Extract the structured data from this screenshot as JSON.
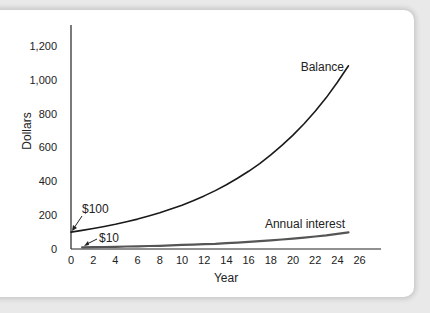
{
  "chart_data": {
    "type": "line",
    "title": "",
    "xlabel": "Year",
    "ylabel": "Dollars",
    "xlim": [
      0,
      26
    ],
    "ylim": [
      0,
      1200
    ],
    "xticks": [
      0,
      2,
      4,
      6,
      8,
      10,
      12,
      14,
      16,
      18,
      20,
      22,
      24,
      26
    ],
    "yticks": [
      0,
      200,
      400,
      600,
      800,
      1000,
      1200
    ],
    "ytick_labels": [
      "0",
      "200",
      "400",
      "600",
      "800",
      "1,000",
      "1,200"
    ],
    "grid": false,
    "legend": "inline labels",
    "series": [
      {
        "name": "Balance",
        "color": "#1a1a1a",
        "x": [
          0,
          1,
          2,
          3,
          4,
          5,
          6,
          7,
          8,
          9,
          10,
          11,
          12,
          13,
          14,
          15,
          16,
          17,
          18,
          19,
          20,
          21,
          22,
          23,
          24,
          25
        ],
        "values": [
          100,
          110,
          121,
          133,
          146,
          161,
          177,
          195,
          214,
          236,
          259,
          285,
          314,
          345,
          380,
          418,
          459,
          505,
          556,
          612,
          673,
          740,
          814,
          895,
          985,
          1083
        ]
      },
      {
        "name": "Annual interest",
        "color": "#555555",
        "x": [
          1,
          2,
          3,
          4,
          5,
          6,
          7,
          8,
          9,
          10,
          11,
          12,
          13,
          14,
          15,
          16,
          17,
          18,
          19,
          20,
          21,
          22,
          23,
          24,
          25
        ],
        "values": [
          10,
          11,
          12,
          13,
          15,
          16,
          18,
          19,
          21,
          24,
          26,
          29,
          31,
          35,
          38,
          42,
          46,
          51,
          56,
          61,
          67,
          74,
          81,
          90,
          98
        ]
      }
    ],
    "annotations": [
      {
        "text": "$100",
        "x": 0,
        "y": 100
      },
      {
        "text": "$10",
        "x": 1,
        "y": 10
      },
      {
        "text": "Balance",
        "x": 25,
        "y": 1083
      },
      {
        "text": "Annual interest",
        "x": 25,
        "y": 98
      }
    ]
  },
  "labels": {
    "xlabel": "Year",
    "ylabel": "Dollars",
    "balance": "Balance",
    "interest": "Annual interest",
    "start_balance": "$100",
    "start_interest": "$10"
  }
}
